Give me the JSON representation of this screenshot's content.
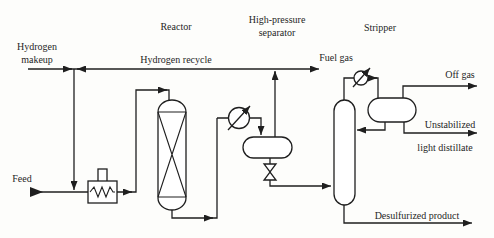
{
  "diagram_type": "process-flow-diagram",
  "labels": {
    "hydrogen_makeup_1": "Hydrogen",
    "hydrogen_makeup_2": "makeup",
    "reactor": "Reactor",
    "hp_separator_1": "High-pressure",
    "hp_separator_2": "separator",
    "stripper": "Stripper",
    "hydrogen_recycle": "Hydrogen recycle",
    "fuel_gas": "Fuel gas",
    "off_gas": "Off gas",
    "distillate_1": "Unstabilized",
    "distillate_2": "light distillate",
    "feed": "Feed",
    "desulfurized_product": "Desulfurized product"
  },
  "equipment_symbols": [
    "feed-furnace-heater",
    "reactor-vessel",
    "effluent-cooler",
    "high-pressure-separator-drum",
    "letdown-valve",
    "stripper-column",
    "overhead-condenser",
    "reflux-drum"
  ],
  "colors": {
    "line": "#1f1f1f",
    "text": "#1f1f1f",
    "background": "#fdfdfb",
    "vessel_fill": "#ffffff"
  }
}
